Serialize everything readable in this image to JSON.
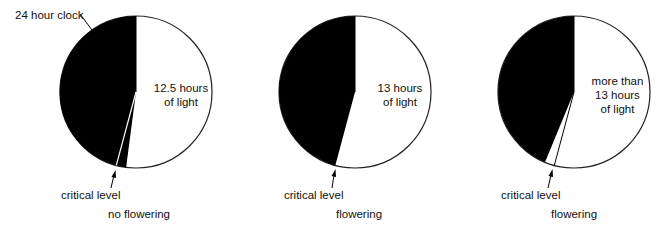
{
  "diagrams": [
    {
      "light_label_lines": [
        "12.5 hours",
        "of light"
      ],
      "critical_label": "critical level",
      "outcome": "no flowering",
      "light_hours": 12.5
    },
    {
      "light_label_lines": [
        "13 hours",
        "of light"
      ],
      "critical_label": "critical level",
      "outcome": "flowering",
      "light_hours": 13
    },
    {
      "light_label_lines": [
        "more than",
        "13 hours",
        "of light"
      ],
      "critical_label": "critical level",
      "outcome": "flowering",
      "light_hours": 13.5
    }
  ],
  "clock_label": "24 hour clock",
  "critical_hours": 13,
  "colors": {
    "dark": "#000000",
    "light": "#ffffff",
    "outline": "#222222"
  }
}
